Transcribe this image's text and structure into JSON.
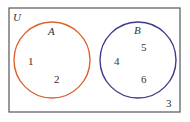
{
  "diagram": {
    "type": "venn",
    "universe": {
      "label": "U",
      "outside_elements": [
        "3"
      ]
    },
    "sets": [
      {
        "label": "A",
        "elements": [
          "1",
          "2"
        ],
        "color": "#e0622e"
      },
      {
        "label": "B",
        "elements": [
          "5",
          "4",
          "6"
        ],
        "color": "#3c3c8c"
      }
    ],
    "border_color": "#555555"
  }
}
